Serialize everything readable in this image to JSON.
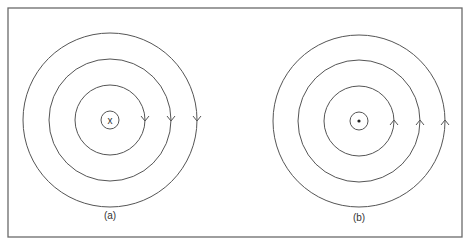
{
  "figure": {
    "frame": {
      "x": 8,
      "y": 8,
      "width": 454,
      "height": 229
    },
    "panels": [
      {
        "id": "a",
        "label": "(a)",
        "center": {
          "x": 110,
          "y": 120
        },
        "conductor_symbol": "x",
        "conductor_meaning": "current into page",
        "conductor_radius": 9,
        "field_line_radii": [
          35,
          61,
          87
        ],
        "arrow_direction": "down",
        "label_position": {
          "x": 110,
          "y": 219
        }
      },
      {
        "id": "b",
        "label": "(b)",
        "center": {
          "x": 359,
          "y": 121
        },
        "conductor_symbol": "•",
        "conductor_meaning": "current out of page",
        "conductor_radius": 9,
        "field_line_radii": [
          35,
          61,
          86
        ],
        "arrow_direction": "up",
        "label_position": {
          "x": 359,
          "y": 221
        }
      }
    ],
    "colors": {
      "line": "#555555",
      "frame": "#6a6a6a",
      "text": "#333333",
      "background": "#ffffff"
    }
  }
}
